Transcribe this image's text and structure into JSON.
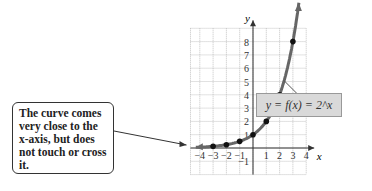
{
  "callout": {
    "text": "The curve comes very close to the x-axis, but does not touch or cross it."
  },
  "function_label": "y = f(x) = 2^x",
  "chart_data": {
    "type": "line",
    "title": "",
    "xlabel": "x",
    "ylabel": "y",
    "x_ticks": [
      -4,
      -3,
      -2,
      -1,
      1,
      2,
      3,
      4
    ],
    "y_ticks": [
      -1,
      1,
      2,
      3,
      4,
      5,
      6,
      7,
      8
    ],
    "xlim": [
      -4.7,
      4
    ],
    "ylim": [
      -2,
      9
    ],
    "grid": true,
    "series": [
      {
        "name": "y = f(x) = 2^x",
        "x": [
          -3,
          -2,
          -1,
          0,
          1,
          2,
          3
        ],
        "y": [
          0.125,
          0.25,
          0.5,
          1,
          2,
          4,
          8
        ]
      }
    ],
    "annotations": [
      "The curve comes very close to the x-axis, but does not touch or cross it.",
      "y = f(x) = 2^x"
    ]
  }
}
